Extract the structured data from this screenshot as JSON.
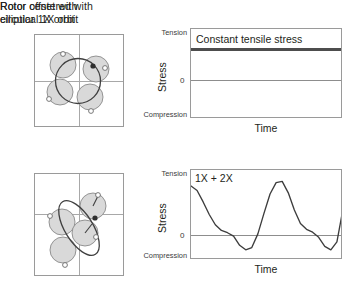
{
  "figure": {
    "panels": [
      {
        "id": "centered",
        "heading": "Rotor centered with\ncircular 1X orbit",
        "orbit": {
          "type": "circular",
          "description": "Rotor centered with circular 1X orbit",
          "rotor_positions": 4,
          "shade_color": "#d9d9d9",
          "outline_color": "#8a8a8a"
        },
        "chart": {
          "type": "line",
          "title": "",
          "annotation": "Constant tensile stress",
          "ylabel": "Stress",
          "xlabel": "Time",
          "ytick_top": "Tension",
          "ytick_zero": "0",
          "ytick_bottom": "Compression",
          "series_name": "Constant tensile stress",
          "values_constant": 0.62,
          "ylim": [
            -1,
            1
          ],
          "grid": false
        }
      },
      {
        "id": "offset",
        "heading": "Rotor offset with\nelliptical 1X orbit",
        "orbit": {
          "type": "elliptical",
          "description": "Rotor offset with elliptical 1X orbit",
          "rotor_positions": 4,
          "shade_color": "#d9d9d9",
          "outline_color": "#8a8a8a"
        },
        "chart": {
          "type": "line",
          "title": "",
          "annotation": "1X + 2X",
          "ylabel": "Stress",
          "xlabel": "Time",
          "ytick_top": "Tension",
          "ytick_zero": "0",
          "ytick_bottom": "Compression",
          "series_name": "1X + 2X",
          "ylim": [
            -1,
            1
          ],
          "grid": false
        }
      }
    ]
  },
  "chart_data": [
    {
      "type": "line",
      "title": "Constant tensile stress",
      "xlabel": "Time",
      "ylabel": "Stress",
      "ytick_labels": [
        "Tension",
        "0",
        "Compression"
      ],
      "ylim": [
        -1,
        1
      ],
      "grid": false,
      "legend": "none",
      "annotations": [
        "Constant tensile stress"
      ],
      "series": [
        {
          "name": "Constant tensile stress",
          "x": [
            0,
            1
          ],
          "values": [
            0.62,
            0.62
          ]
        }
      ]
    },
    {
      "type": "line",
      "title": "1X + 2X",
      "xlabel": "Time",
      "ylabel": "Stress",
      "ytick_labels": [
        "Tension",
        "0",
        "Compression"
      ],
      "ylim": [
        -1,
        1
      ],
      "grid": false,
      "legend": "none",
      "annotations": [
        "1X + 2X"
      ],
      "series": [
        {
          "name": "1X + 2X",
          "x": [
            0.0,
            0.04,
            0.08,
            0.12,
            0.16,
            0.2,
            0.24,
            0.28,
            0.32,
            0.36,
            0.4,
            0.44,
            0.48,
            0.52,
            0.56,
            0.6,
            0.64,
            0.68,
            0.72,
            0.76,
            0.8,
            0.84,
            0.88,
            0.92,
            0.96,
            1.0
          ],
          "values": [
            0.86,
            0.78,
            0.58,
            0.36,
            0.18,
            0.08,
            0.04,
            -0.02,
            -0.18,
            -0.26,
            -0.22,
            0.02,
            0.38,
            0.72,
            0.92,
            0.94,
            0.74,
            0.44,
            0.2,
            0.1,
            0.05,
            -0.04,
            -0.2,
            -0.26,
            -0.12,
            0.46
          ]
        }
      ]
    }
  ]
}
